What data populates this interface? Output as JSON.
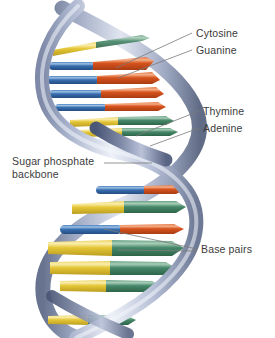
{
  "diagram": {
    "background_color": "#ffffff"
  },
  "labels": [
    {
      "id": "cytosine",
      "text": "Cytosine",
      "points_to": "base-rod-orange"
    },
    {
      "id": "guanine",
      "text": "Guanine",
      "points_to": "base-rod-blue"
    },
    {
      "id": "thymine",
      "text": "Thymine",
      "points_to": "base-rod-green"
    },
    {
      "id": "adenine",
      "text": "Adenine",
      "points_to": "base-rod-yellow"
    },
    {
      "id": "backbone",
      "text": "Sugar phosphate backbone",
      "line1": "Sugar phosphate",
      "line2": "backbone",
      "points_to": "helix-ribbon"
    },
    {
      "id": "basepairs",
      "text": "Base pairs",
      "points_to": "base-pair-group"
    }
  ],
  "colors": {
    "label_text": "#3b3b3b",
    "leader_line": "#7a7a7a",
    "backbone_ribbon_light": "#e8ecf6",
    "backbone_ribbon_mid": "#b4bdd6",
    "backbone_ribbon_dark": "#6b7794",
    "backbone_ribbon_shadow": "#4a5675",
    "base_blue": "#2f66a8",
    "base_blue_light": "#6f9ad0",
    "base_orange": "#d4541e",
    "base_orange_light": "#ea8254",
    "base_yellow": "#e8c840",
    "base_yellow_light": "#f5e08a",
    "base_green": "#4a8a6a",
    "base_green_light": "#86b89a"
  },
  "base_pairs": [
    {
      "index": 1,
      "section": "upper",
      "left_color": "base_yellow",
      "right_color": "base_green",
      "left_base": "Adenine",
      "right_base": "Thymine"
    },
    {
      "index": 2,
      "section": "upper",
      "left_color": "base_blue",
      "right_color": "base_orange",
      "left_base": "Guanine",
      "right_base": "Cytosine"
    },
    {
      "index": 3,
      "section": "upper",
      "left_color": "base_blue",
      "right_color": "base_orange",
      "left_base": "Guanine",
      "right_base": "Cytosine"
    },
    {
      "index": 4,
      "section": "upper",
      "left_color": "base_blue",
      "right_color": "base_orange",
      "left_base": "Guanine",
      "right_base": "Cytosine"
    },
    {
      "index": 5,
      "section": "upper",
      "left_color": "base_yellow",
      "right_color": "base_green",
      "left_base": "Adenine",
      "right_base": "Thymine"
    },
    {
      "index": 6,
      "section": "lower",
      "left_color": "base_blue",
      "right_color": "base_orange",
      "left_base": "Guanine",
      "right_base": "Cytosine"
    },
    {
      "index": 7,
      "section": "lower",
      "left_color": "base_yellow",
      "right_color": "base_green",
      "left_base": "Adenine",
      "right_base": "Thymine"
    },
    {
      "index": 8,
      "section": "lower",
      "left_color": "base_blue",
      "right_color": "base_orange",
      "left_base": "Guanine",
      "right_base": "Cytosine"
    },
    {
      "index": 9,
      "section": "lower",
      "left_color": "base_yellow",
      "right_color": "base_green",
      "left_base": "Adenine",
      "right_base": "Thymine"
    },
    {
      "index": 10,
      "section": "lower",
      "left_color": "base_yellow",
      "right_color": "base_green",
      "left_base": "Adenine",
      "right_base": "Thymine"
    },
    {
      "index": 11,
      "section": "bottom",
      "left_color": "base_yellow",
      "right_color": "base_green",
      "left_base": "Adenine",
      "right_base": "Thymine"
    }
  ]
}
